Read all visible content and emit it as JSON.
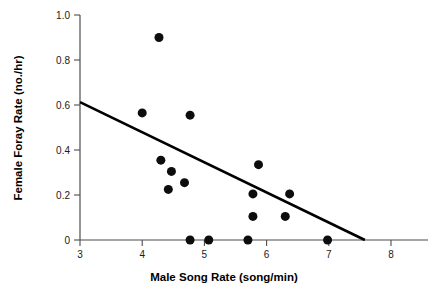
{
  "chart_data": {
    "type": "scatter",
    "title": "",
    "xlabel": "Male Song Rate (song/min)",
    "ylabel": "Female Foray Rate (no./hr)",
    "xlim": [
      3,
      8.6
    ],
    "ylim": [
      0,
      1.0
    ],
    "xticks": [
      3,
      4,
      5,
      6,
      7,
      8
    ],
    "xtick_labels": [
      "3",
      "4",
      "5",
      "6",
      "7",
      "8"
    ],
    "yticks": [
      0,
      0.2,
      0.4,
      0.6,
      0.8,
      1.0
    ],
    "ytick_labels": [
      "0",
      "0.2",
      "0.4",
      "0.6",
      "0.8",
      "1.0"
    ],
    "grid": false,
    "legend": null,
    "marker": {
      "shape": "circle",
      "color": "#0d0d0d",
      "size": 9
    },
    "points": [
      {
        "x": 4.27,
        "y": 0.9
      },
      {
        "x": 4.0,
        "y": 0.565
      },
      {
        "x": 4.77,
        "y": 0.555
      },
      {
        "x": 4.3,
        "y": 0.355
      },
      {
        "x": 4.47,
        "y": 0.305
      },
      {
        "x": 4.68,
        "y": 0.255
      },
      {
        "x": 4.42,
        "y": 0.225
      },
      {
        "x": 5.87,
        "y": 0.335
      },
      {
        "x": 6.37,
        "y": 0.205
      },
      {
        "x": 5.78,
        "y": 0.205
      },
      {
        "x": 5.78,
        "y": 0.105
      },
      {
        "x": 6.3,
        "y": 0.105
      },
      {
        "x": 4.77,
        "y": 0.0
      },
      {
        "x": 5.07,
        "y": 0.0
      },
      {
        "x": 5.7,
        "y": 0.0
      },
      {
        "x": 6.98,
        "y": 0.0
      }
    ],
    "trendline": {
      "type": "linear",
      "color": "#000000",
      "x_start": 3.0,
      "y_start": 0.613,
      "x_end": 7.58,
      "y_end": 0.0
    }
  }
}
